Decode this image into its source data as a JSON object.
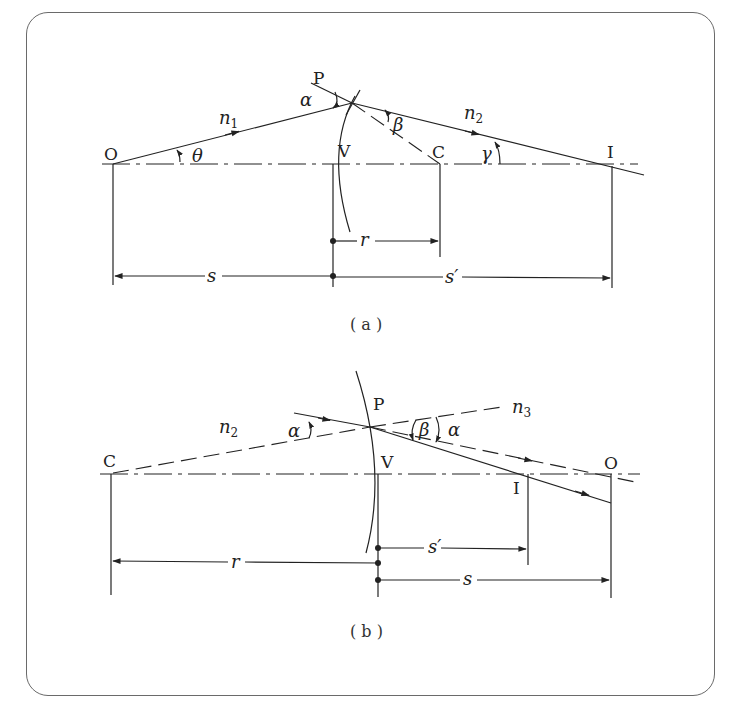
{
  "figure": {
    "panel_a": {
      "caption": "( a )",
      "points": {
        "O": "O",
        "P": "P",
        "V": "V",
        "C": "C",
        "I": "I"
      },
      "media": {
        "n1": "n",
        "n1_sub": "1",
        "n2": "n",
        "n2_sub": "2"
      },
      "angles": {
        "alpha": "α",
        "beta": "β",
        "theta": "θ",
        "gamma": "γ"
      },
      "dimensions": {
        "r": "r",
        "s": "s",
        "s_prime": "s′"
      }
    },
    "panel_b": {
      "caption": "( b )",
      "points": {
        "C": "C",
        "P": "P",
        "V": "V",
        "I": "I",
        "O": "O"
      },
      "media": {
        "n2": "n",
        "n2_sub": "2",
        "n3": "n",
        "n3_sub": "3"
      },
      "angles": {
        "alpha_left": "α",
        "beta": "β",
        "alpha_right": "α"
      },
      "dimensions": {
        "r": "r",
        "s": "s",
        "s_prime": "s′"
      }
    }
  }
}
